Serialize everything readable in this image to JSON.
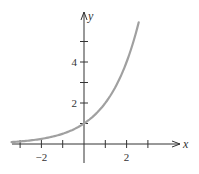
{
  "chart_data": {
    "type": "line",
    "title": "",
    "function": "y = 2^x",
    "xlabel": "x",
    "ylabel": "y",
    "xlim": [
      -3.4,
      4.5
    ],
    "ylim": [
      -0.9,
      6.4
    ],
    "grid": false,
    "legend": null,
    "x_ticks": [
      -3,
      -2,
      -1,
      1,
      2,
      3
    ],
    "x_tick_labels": [
      {
        "value": -2,
        "label": "−2"
      },
      {
        "value": 2,
        "label": "2"
      }
    ],
    "y_ticks": [
      1,
      2,
      3,
      4,
      5
    ],
    "y_tick_labels": [
      {
        "value": 2,
        "label": "2"
      },
      {
        "value": 4,
        "label": "4"
      }
    ],
    "series": [
      {
        "name": "y = 2^x",
        "x": [
          -3.4,
          -3,
          -2,
          -1,
          0,
          1,
          2,
          2.5,
          2.57
        ],
        "y": [
          0.09,
          0.125,
          0.25,
          0.5,
          1,
          2,
          4,
          5.66,
          5.94
        ]
      }
    ],
    "colors": {
      "axes": "#333333",
      "curve": "#a0a0a0"
    }
  }
}
